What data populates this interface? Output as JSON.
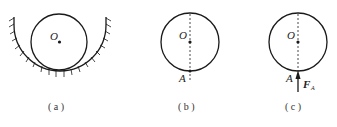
{
  "figure": {
    "panels": [
      {
        "id": "a",
        "caption": "( a )",
        "center_label": "O",
        "description": "Circular cylinder resting in a fixed semicircular hatched support"
      },
      {
        "id": "b",
        "caption": "( b )",
        "center_label": "O",
        "contact_label": "A",
        "description": "Free cylinder with dashed line from center O to contact point A"
      },
      {
        "id": "c",
        "caption": "( c )",
        "center_label": "O",
        "contact_label": "A",
        "force_label": "F",
        "force_subscript": "A",
        "description": "Free body diagram with normal force F_A acting upward at A"
      }
    ],
    "colors": {
      "stroke": "#1a1a1a",
      "text": "#222222"
    }
  }
}
